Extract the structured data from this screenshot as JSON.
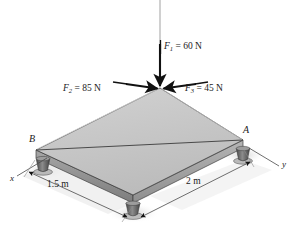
{
  "figure": {
    "type": "statics-free-body-diagram"
  },
  "forces": [
    {
      "id": "F1",
      "symbol": "F",
      "subscript": "1",
      "equals": "=",
      "magnitude": "60",
      "unit": "N",
      "label": "F1 = 60 N",
      "direction": "vertical-downward"
    },
    {
      "id": "F2",
      "symbol": "F",
      "subscript": "2",
      "equals": "=",
      "magnitude": "85",
      "unit": "N",
      "label": "F2 = 85 N",
      "direction": "down-right-along-edge"
    },
    {
      "id": "F3",
      "symbol": "F",
      "subscript": "3",
      "equals": "=",
      "magnitude": "45",
      "unit": "N",
      "label": "F3 = 45 N",
      "direction": "down-left-along-edge"
    }
  ],
  "points": [
    {
      "id": "A",
      "label": "A"
    },
    {
      "id": "B",
      "label": "B"
    }
  ],
  "axes": [
    {
      "id": "x",
      "label": "x"
    },
    {
      "id": "y",
      "label": "y"
    }
  ],
  "dimensions": [
    {
      "id": "dim-left",
      "value": "1.5",
      "unit": "m",
      "label": "1.5 m"
    },
    {
      "id": "dim-right",
      "value": "2",
      "unit": "m",
      "label": "2 m"
    }
  ],
  "colors": {
    "plate_top": "#c6c6c6",
    "plate_edge_front": "#9a9a9a",
    "plate_edge_side": "#858585",
    "outline": "#3a3a3a",
    "arrow": "#111111",
    "ground_shadow": "#e2e2e2",
    "support": "#6e6e6e",
    "text": "#1a1a1a",
    "background": "#ffffff"
  }
}
